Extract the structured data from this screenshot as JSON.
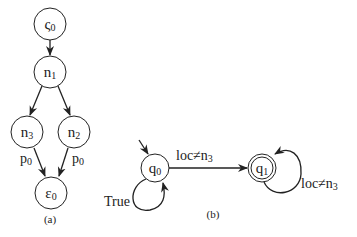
{
  "panel_a": {
    "caption": "(a)",
    "nodes": [
      {
        "id": "s0",
        "base": "ς",
        "sub": "0"
      },
      {
        "id": "n1",
        "base": "n",
        "sub": "1"
      },
      {
        "id": "n3",
        "base": "n",
        "sub": "3"
      },
      {
        "id": "n2",
        "base": "n",
        "sub": "2"
      },
      {
        "id": "e0",
        "base": "ε",
        "sub": "0"
      }
    ],
    "edges": [
      {
        "from": "s0",
        "to": "n1",
        "label": ""
      },
      {
        "from": "n1",
        "to": "n3",
        "label": ""
      },
      {
        "from": "n1",
        "to": "n2",
        "label": ""
      },
      {
        "from": "n3",
        "to": "e0",
        "label_base": "p",
        "label_sub": "0"
      },
      {
        "from": "n2",
        "to": "e0",
        "label_base": "p",
        "label_sub": "0"
      }
    ]
  },
  "panel_b": {
    "caption": "(b)",
    "states": [
      {
        "id": "q0",
        "base": "q",
        "sub": "0",
        "initial": true,
        "accepting": false
      },
      {
        "id": "q1",
        "base": "q",
        "sub": "1",
        "initial": false,
        "accepting": true
      }
    ],
    "transitions": [
      {
        "from": "q0",
        "to": "q0",
        "label": "True"
      },
      {
        "from": "q0",
        "to": "q1",
        "label_base": "loc≠n",
        "label_sub": "3"
      },
      {
        "from": "q1",
        "to": "q1",
        "label_base": "loc≠n",
        "label_sub": "3"
      }
    ]
  }
}
